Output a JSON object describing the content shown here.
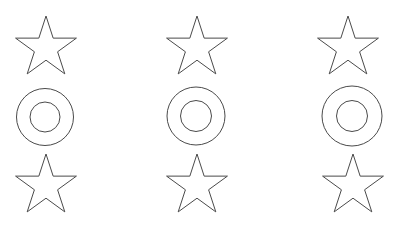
{
  "canvas": {
    "width": 398,
    "height": 227,
    "background": "#ffffff"
  },
  "style": {
    "stroke": "#4a4a4a",
    "stroke_width": 1
  },
  "grid": {
    "columns": 3,
    "rows": 3,
    "pattern": [
      "star",
      "ring",
      "star"
    ]
  },
  "shapes": [
    {
      "type": "star",
      "name": "star-col1-top",
      "cx": 46,
      "cy": 48,
      "outer_r": 32,
      "inner_r": 12.2
    },
    {
      "type": "ring",
      "name": "ring-col1-middle",
      "cx": 45,
      "cy": 117,
      "outer_r": 28.5,
      "inner_r": 15
    },
    {
      "type": "star",
      "name": "star-col1-bottom",
      "cx": 46,
      "cy": 186,
      "outer_r": 32,
      "inner_r": 12.2
    },
    {
      "type": "star",
      "name": "star-col2-top",
      "cx": 197,
      "cy": 48,
      "outer_r": 32,
      "inner_r": 12.2
    },
    {
      "type": "ring",
      "name": "ring-col2-middle",
      "cx": 196,
      "cy": 116,
      "outer_r": 29,
      "inner_r": 15.5
    },
    {
      "type": "star",
      "name": "star-col2-bottom",
      "cx": 197,
      "cy": 186,
      "outer_r": 32,
      "inner_r": 12.2
    },
    {
      "type": "star",
      "name": "star-col3-top",
      "cx": 348,
      "cy": 48,
      "outer_r": 32,
      "inner_r": 12.2
    },
    {
      "type": "ring",
      "name": "ring-col3-middle",
      "cx": 352,
      "cy": 116,
      "outer_r": 30,
      "inner_r": 15.5
    },
    {
      "type": "star",
      "name": "star-col3-bottom",
      "cx": 353,
      "cy": 186,
      "outer_r": 32,
      "inner_r": 12.2
    }
  ]
}
